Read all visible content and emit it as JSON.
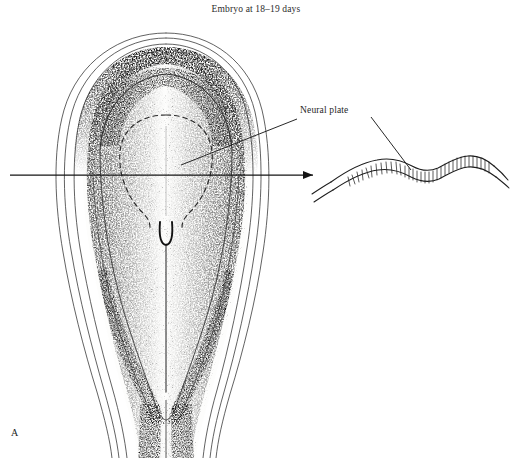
{
  "figure": {
    "title": "Embryo at 18–19 days",
    "panel_letter": "A",
    "background_color": "#ffffff",
    "ink_color": "#1a1a1a"
  },
  "labels": [
    {
      "id": "neural-plate",
      "text": "Neural plate",
      "x": 300,
      "y": 105,
      "leaders": [
        {
          "to": "dorsal-view",
          "from_x": 298,
          "from_y": 118,
          "to_x": 181,
          "to_y": 164
        },
        {
          "to": "transverse-section",
          "from_x": 372,
          "from_y": 118,
          "to_x": 410,
          "to_y": 168
        }
      ]
    }
  ],
  "section_plane_arrow": {
    "name": "section-level-arrow",
    "x1": 10,
    "y1": 175,
    "x2": 316,
    "y2": 175,
    "arrowhead": "right"
  },
  "dorsal_view": {
    "name": "embryonic-disc-dorsal-view",
    "description": "Stipple-shaded dorsal view of embryonic disc with amnion cut edge, neural plate, primitive node and primitive streak",
    "outer_envelope_bounds": {
      "x": 55,
      "y": 32,
      "width": 210,
      "height": 426
    },
    "parts": [
      {
        "name": "amnion-cut-edge",
        "style": "thin contour lines"
      },
      {
        "name": "neural-plate-outline",
        "style": "dashed",
        "cx": 165,
        "cy": 160
      },
      {
        "name": "primitive-node",
        "cx": 166,
        "cy": 234
      },
      {
        "name": "primitive-streak",
        "x": 166,
        "y1": 243,
        "y2": 390
      },
      {
        "name": "connecting-stalk",
        "x": 166,
        "y1": 400,
        "y2": 458
      }
    ]
  },
  "transverse_section": {
    "name": "neural-plate-transverse-section",
    "description": "Wavy bilaminar band with columnar cell hatching representing thickened neural plate in section",
    "bounds": {
      "x": 330,
      "y": 150,
      "width": 170,
      "height": 50
    },
    "cell_hatch_count": 34
  }
}
